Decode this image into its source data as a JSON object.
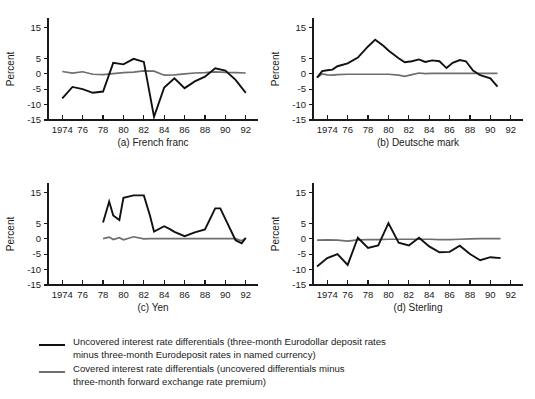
{
  "figure": {
    "background": "#ffffff",
    "uncovered_color": "#111111",
    "covered_color": "#6e6e6e"
  },
  "axis": {
    "ylabel": "Percent",
    "y_ticks": [
      "15",
      "5",
      "0",
      "-5",
      "-10",
      "-15"
    ],
    "y_tick_values": [
      15,
      5,
      0,
      -5,
      -10,
      -15
    ],
    "ylim": [
      -15,
      18
    ],
    "x_ticks": [
      "1974",
      "76",
      "78",
      "80",
      "82",
      "84",
      "86",
      "88",
      "90",
      "92"
    ],
    "x_tick_values": [
      1974,
      1976,
      1978,
      1980,
      1982,
      1984,
      1986,
      1988,
      1990,
      1992
    ],
    "xlim": [
      1972.6,
      1993.2
    ],
    "grid": false
  },
  "legend": {
    "position": "below",
    "entries": [
      {
        "swatch": "uncovered-line-swatch",
        "color": "#111111",
        "line1": "Uncovered interest rate differentials (three-month Eurodollar deposit rates",
        "line2": "minus three-month Eurodeposit rates in named currency)"
      },
      {
        "swatch": "covered-line-swatch",
        "color": "#6e6e6e",
        "line1": "Covered interest rate differentials (uncovered differentials minus",
        "line2": "three-month forward exchange rate premium)"
      }
    ]
  },
  "chart_data": [
    {
      "type": "line",
      "id": "french-franc",
      "title": "(a) French franc",
      "xlabel": "",
      "ylabel": "Percent",
      "xlim": [
        1972.6,
        1993.2
      ],
      "ylim": [
        -15,
        18
      ],
      "x": [
        1974,
        1975,
        1976,
        1977,
        1978,
        1979,
        1980,
        1981,
        1982,
        1983,
        1984,
        1985,
        1986,
        1987,
        1988,
        1989,
        1990,
        1991,
        1992
      ],
      "series": [
        {
          "name": "Uncovered interest rate differentials",
          "color": "#111111",
          "values": [
            -8.0,
            -4.3,
            -5.0,
            -6.2,
            -5.8,
            3.5,
            3.0,
            4.8,
            3.8,
            -14.0,
            -4.5,
            -1.5,
            -4.7,
            -2.5,
            -1.0,
            1.7,
            1.0,
            -2.0,
            -6.2
          ]
        },
        {
          "name": "Covered interest rate differentials",
          "color": "#6e6e6e",
          "values": [
            0.7,
            0.2,
            0.6,
            -0.2,
            -0.3,
            0.0,
            0.3,
            0.5,
            0.9,
            0.8,
            -0.5,
            -0.4,
            -0.1,
            0.2,
            0.3,
            0.6,
            0.4,
            0.3,
            0.2
          ]
        }
      ]
    },
    {
      "type": "line",
      "id": "deutsche-mark",
      "title": "(b) Deutsche mark",
      "xlabel": "",
      "ylabel": "Percent",
      "xlim": [
        1972.6,
        1993.2
      ],
      "ylim": [
        -15,
        18
      ],
      "x": [
        1973,
        1973.5,
        1974,
        1974.5,
        1975,
        1976,
        1977,
        1978,
        1978.7,
        1979.5,
        1980,
        1981,
        1981.6,
        1982.3,
        1983,
        1983.6,
        1984.3,
        1985,
        1985.7,
        1986.3,
        1987,
        1987.6,
        1988.3,
        1989,
        1990,
        1990.7
      ],
      "series": [
        {
          "name": "Uncovered interest rate differentials",
          "color": "#111111",
          "values": [
            -1.3,
            0.8,
            1.1,
            1.3,
            2.4,
            3.3,
            5.2,
            8.8,
            11.0,
            9.0,
            7.5,
            5.0,
            3.7,
            4.0,
            4.6,
            3.8,
            4.3,
            4.0,
            1.8,
            3.5,
            4.4,
            4.0,
            1.0,
            -0.5,
            -1.5,
            -4.2
          ]
        },
        {
          "name": "Covered interest rate differentials",
          "color": "#6e6e6e",
          "values": [
            -1.2,
            -0.1,
            -0.4,
            -0.5,
            -0.3,
            -0.2,
            -0.2,
            -0.2,
            -0.2,
            -0.2,
            -0.2,
            -0.5,
            -0.9,
            -0.3,
            0.2,
            0.0,
            0.1,
            0.1,
            0.1,
            0.1,
            0.1,
            0.1,
            0.1,
            0.1,
            0.1,
            0.1
          ]
        }
      ]
    },
    {
      "type": "line",
      "id": "yen",
      "title": "(c) Yen",
      "xlabel": "",
      "ylabel": "Percent",
      "xlim": [
        1972.6,
        1993.2
      ],
      "ylim": [
        -15,
        18
      ],
      "x": [
        1978,
        1978.6,
        1979,
        1979.6,
        1980,
        1981,
        1982,
        1982.6,
        1983,
        1984,
        1984.6,
        1985,
        1986,
        1987,
        1988,
        1989,
        1989.5,
        1991,
        1991.6,
        1992
      ],
      "series": [
        {
          "name": "Uncovered interest rate differentials",
          "color": "#111111",
          "values": [
            5.2,
            12.0,
            7.5,
            6.0,
            13.2,
            14.0,
            14.0,
            7.5,
            2.3,
            4.0,
            3.0,
            2.2,
            0.8,
            2.0,
            3.0,
            9.8,
            9.8,
            -0.5,
            -1.5,
            0.2
          ]
        },
        {
          "name": "Covered interest rate differentials",
          "color": "#6e6e6e",
          "values": [
            0.0,
            0.5,
            -0.3,
            0.3,
            -0.4,
            0.6,
            -0.1,
            0.0,
            0.0,
            0.0,
            0.0,
            0.0,
            0.0,
            0.0,
            0.0,
            0.0,
            0.0,
            0.0,
            -0.7,
            0.2
          ]
        }
      ]
    },
    {
      "type": "line",
      "id": "sterling",
      "title": "(d) Sterling",
      "xlabel": "",
      "ylabel": "Percent",
      "xlim": [
        1972.6,
        1993.2
      ],
      "ylim": [
        -15,
        18
      ],
      "x": [
        1973,
        1974,
        1975,
        1976,
        1977,
        1978,
        1979,
        1980,
        1981,
        1982,
        1983,
        1984,
        1985,
        1986,
        1987,
        1988,
        1989,
        1990,
        1991
      ],
      "series": [
        {
          "name": "Uncovered interest rate differentials",
          "color": "#111111",
          "values": [
            -9.0,
            -6.3,
            -5.0,
            -8.5,
            0.3,
            -3.0,
            -2.2,
            5.0,
            -1.3,
            -2.2,
            0.3,
            -2.5,
            -4.4,
            -4.3,
            -2.3,
            -5.0,
            -7.0,
            -6.0,
            -6.3
          ]
        },
        {
          "name": "Covered interest rate differentials",
          "color": "#6e6e6e",
          "values": [
            -0.5,
            -0.4,
            -0.5,
            -0.8,
            -0.4,
            -0.3,
            -0.3,
            -0.2,
            -0.2,
            -0.2,
            -0.2,
            -0.2,
            -0.3,
            -0.3,
            -0.2,
            -0.1,
            0.0,
            0.0,
            0.0
          ]
        }
      ]
    }
  ]
}
